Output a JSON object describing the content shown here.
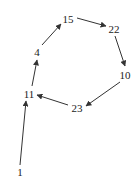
{
  "diagram": {
    "type": "directed-graph",
    "colors": {
      "edge": "#333333",
      "label": "#222222",
      "background": "#ffffff"
    },
    "nodes": [
      {
        "id": "n15",
        "label": "15",
        "x": 68,
        "y": 19
      },
      {
        "id": "n22",
        "label": "22",
        "x": 114,
        "y": 29
      },
      {
        "id": "n10",
        "label": "10",
        "x": 125,
        "y": 75
      },
      {
        "id": "n23",
        "label": "23",
        "x": 77,
        "y": 108
      },
      {
        "id": "n11",
        "label": "11",
        "x": 29,
        "y": 94
      },
      {
        "id": "n4",
        "label": "4",
        "x": 37,
        "y": 52
      },
      {
        "id": "n1",
        "label": "1",
        "x": 20,
        "y": 172
      }
    ],
    "edges": [
      {
        "from": "1",
        "to": "11",
        "x1": 20,
        "y1": 165,
        "x2": 26,
        "y2": 101
      },
      {
        "from": "11",
        "to": "4",
        "x1": 32,
        "y1": 86,
        "x2": 37,
        "y2": 60
      },
      {
        "from": "4",
        "to": "15",
        "x1": 42,
        "y1": 45,
        "x2": 61,
        "y2": 24
      },
      {
        "from": "15",
        "to": "22",
        "x1": 77,
        "y1": 18,
        "x2": 106,
        "y2": 26
      },
      {
        "from": "22",
        "to": "10",
        "x1": 115,
        "y1": 36,
        "x2": 125,
        "y2": 66
      },
      {
        "from": "10",
        "to": "23",
        "x1": 120,
        "y1": 82,
        "x2": 86,
        "y2": 106
      },
      {
        "from": "23",
        "to": "11",
        "x1": 68,
        "y1": 105,
        "x2": 37,
        "y2": 95
      }
    ]
  }
}
